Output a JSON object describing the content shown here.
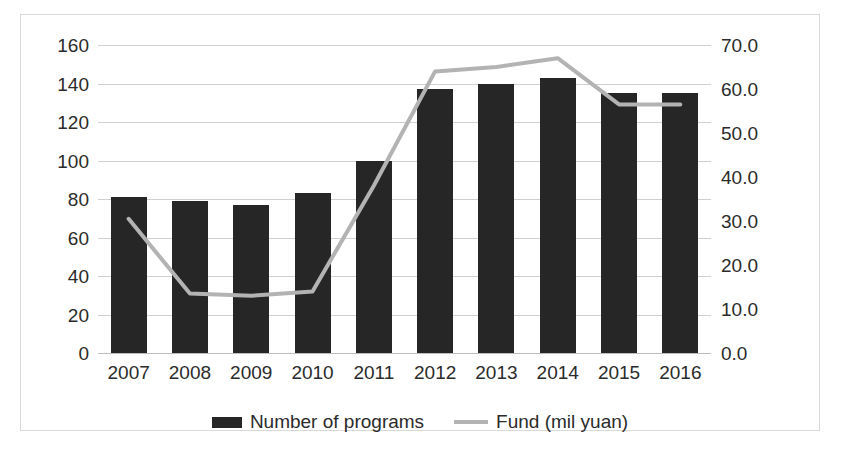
{
  "chart_data": {
    "type": "bar",
    "title": "",
    "xlabel": "",
    "ylabel": "",
    "grid": true,
    "legend_position": "bottom-center",
    "categories": [
      "2007",
      "2008",
      "2009",
      "2010",
      "2011",
      "2012",
      "2013",
      "2014",
      "2015",
      "2016"
    ],
    "axes": {
      "left": {
        "label": "",
        "ylim": [
          0,
          160
        ],
        "tick_step": 20,
        "ticks": [
          "0",
          "20",
          "40",
          "60",
          "80",
          "100",
          "120",
          "140",
          "160"
        ]
      },
      "right": {
        "label": "",
        "ylim": [
          0,
          70
        ],
        "tick_step": 10,
        "ticks": [
          "0.0",
          "10.0",
          "20.0",
          "30.0",
          "40.0",
          "50.0",
          "60.0",
          "70.0"
        ]
      }
    },
    "series": [
      {
        "name": "Number of programs",
        "render": "bar",
        "axis": "left",
        "color": "#262626",
        "values": [
          81,
          79,
          77,
          83,
          100,
          137,
          140,
          143,
          135,
          135
        ]
      },
      {
        "name": "Fund (mil yuan)",
        "render": "line",
        "axis": "right",
        "color": "#b3b3b3",
        "values": [
          30.5,
          13.5,
          13.0,
          14.0,
          38.0,
          64.0,
          65.0,
          67.0,
          56.5,
          56.5
        ]
      }
    ]
  },
  "legend": {
    "items": [
      {
        "label": "Number of programs",
        "swatch": "bar-swatch",
        "color": "#262626"
      },
      {
        "label": "Fund (mil yuan)",
        "swatch": "line-swatch",
        "color": "#b3b3b3"
      }
    ]
  }
}
